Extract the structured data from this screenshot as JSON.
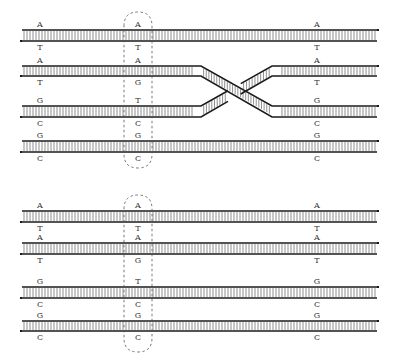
{
  "diagram": {
    "colors": {
      "strand": "#1a1a1a",
      "rung": "#444444",
      "label": "#333333",
      "dashed_ellipse": "#555555"
    },
    "x_start": 22,
    "x_end": 377,
    "rung_spacing": 3,
    "label_columns": {
      "left": 40,
      "middle": 138,
      "right": 317
    },
    "highlight_ellipse": {
      "cx": 138,
      "width": 28
    },
    "panels": [
      {
        "name": "top-panel",
        "ellipse_y": [
          12,
          168
        ],
        "crossover": {
          "between_rows": [
            1,
            2
          ],
          "x_left": 193,
          "x_right": 280
        },
        "duplexes": [
          {
            "top_y": 30,
            "bot_y": 41,
            "top_labels": [
              "A",
              "A",
              "A"
            ],
            "bot_labels": [
              "T",
              "T",
              "T"
            ]
          },
          {
            "top_y": 66,
            "bot_y": 76,
            "top_labels": [
              "A",
              "A",
              "A"
            ],
            "bot_labels": [
              "T",
              "G",
              "T"
            ]
          },
          {
            "top_y": 106,
            "bot_y": 117,
            "top_labels": [
              "G",
              "T",
              "G"
            ],
            "bot_labels": [
              "C",
              "C",
              "C"
            ]
          },
          {
            "top_y": 141,
            "bot_y": 152,
            "top_labels": [
              "G",
              "G",
              "G"
            ],
            "bot_labels": [
              "C",
              "C",
              "C"
            ]
          }
        ]
      },
      {
        "name": "bottom-panel",
        "ellipse_y": [
          195,
          352
        ],
        "crossover": null,
        "duplexes": [
          {
            "top_y": 211,
            "bot_y": 222,
            "top_labels": [
              "A",
              "A",
              "A"
            ],
            "bot_labels": [
              "T",
              "T",
              "T"
            ]
          },
          {
            "top_y": 243,
            "bot_y": 254,
            "top_labels": [
              "A",
              "A",
              "A"
            ],
            "bot_labels": [
              "T",
              "G",
              "T"
            ]
          },
          {
            "top_y": 287,
            "bot_y": 298,
            "top_labels": [
              "G",
              "T",
              "G"
            ],
            "bot_labels": [
              "C",
              "C",
              "C"
            ]
          },
          {
            "top_y": 321,
            "bot_y": 331,
            "top_labels": [
              "G",
              "G",
              "G"
            ],
            "bot_labels": [
              "C",
              "C",
              "C"
            ]
          }
        ]
      }
    ]
  }
}
